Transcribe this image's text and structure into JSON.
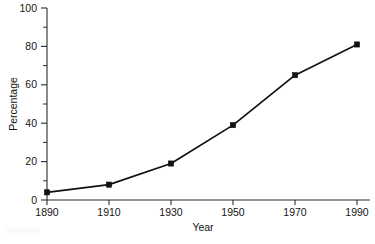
{
  "chart_data": {
    "type": "line",
    "title": "",
    "subtitle": "",
    "xlabel": "Year",
    "ylabel": "Percentage",
    "x": [
      1890,
      1910,
      1930,
      1950,
      1970,
      1990
    ],
    "values": [
      4,
      8,
      19,
      39,
      65,
      81
    ],
    "series": [
      {
        "name": "Percentage",
        "values": [
          4,
          8,
          19,
          39,
          65,
          81
        ]
      }
    ],
    "xticklabels": [
      "1890",
      "1910",
      "1930",
      "1950",
      "1970",
      "1990"
    ],
    "yticklabels": [
      "0",
      "20",
      "40",
      "60",
      "80",
      "100"
    ],
    "yticks": [
      0,
      20,
      40,
      60,
      80,
      100
    ],
    "yminorticks": [
      10,
      30,
      50,
      70,
      90
    ],
    "xlim": [
      1890,
      1990
    ],
    "ylim": [
      0,
      100
    ],
    "grid": false,
    "legend": false,
    "legend_position": "none",
    "marker": "square",
    "line_color": "#111111",
    "marker_color": "#111111",
    "background_color": "#ffffff"
  },
  "axes": {
    "x_axis_title": "Year",
    "y_axis_title": "Percentage"
  }
}
